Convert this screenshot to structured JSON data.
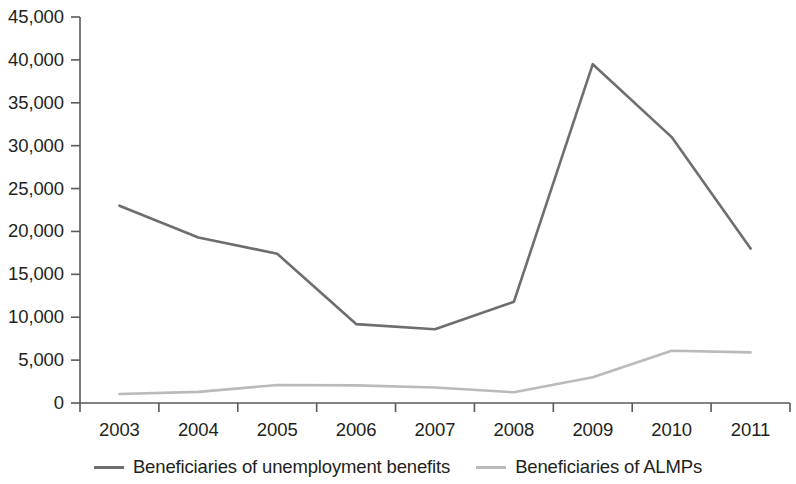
{
  "chart_data": {
    "type": "line",
    "title": "",
    "subtitle": "",
    "xlabel": "",
    "ylabel": "",
    "categories": [
      "2003",
      "2004",
      "2005",
      "2006",
      "2007",
      "2008",
      "2009",
      "2010",
      "2011"
    ],
    "series": [
      {
        "name": "Beneficiaries of unemployment benefits",
        "color": "#6d6e71",
        "values": [
          23000,
          19300,
          17400,
          9200,
          8600,
          11800,
          39500,
          31000,
          18000
        ]
      },
      {
        "name": "Beneficiaries of ALMPs",
        "color": "#b9babc",
        "values": [
          1050,
          1300,
          2100,
          2050,
          1800,
          1250,
          3000,
          6100,
          5900
        ]
      }
    ],
    "ylim": [
      0,
      45000
    ],
    "yticks": [
      0,
      5000,
      10000,
      15000,
      20000,
      25000,
      30000,
      35000,
      40000,
      45000
    ],
    "ytick_labels": [
      "0",
      "5,000",
      "10,000",
      "15,000",
      "20,000",
      "25,000",
      "30,000",
      "35,000",
      "40,000",
      "45,000"
    ],
    "grid": false,
    "legend_position": "bottom",
    "axis_color": "#58595b",
    "background": "#ffffff"
  },
  "legend": {
    "items": [
      {
        "label": "Beneficiaries of unemployment benefits",
        "color": "#6d6e71"
      },
      {
        "label": "Beneficiaries of ALMPs",
        "color": "#b9babc"
      }
    ]
  }
}
